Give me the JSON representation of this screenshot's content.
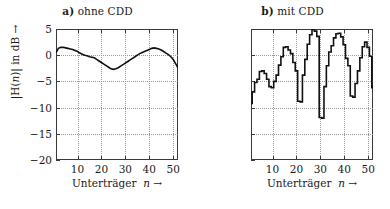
{
  "figure": {
    "background": "#ffffff",
    "ink": "#1a1a1a",
    "grid_color": "#9a9a9a"
  },
  "panels": [
    {
      "id": "panel-a",
      "title_lead": "a)",
      "title_text": "ohne CDD",
      "show_ylabel": true,
      "ylabel_prefix": "|H(",
      "ylabel_var": "n",
      "ylabel_suffix": ")| in dB →",
      "xlabel_text": "Unterträger",
      "xlabel_var": "n",
      "xlabel_arrow": "→"
    },
    {
      "id": "panel-b",
      "title_lead": "b)",
      "title_text": "mit CDD",
      "show_ylabel": false,
      "ylabel_prefix": "|H(",
      "ylabel_var": "n",
      "ylabel_suffix": ")| in dB →",
      "xlabel_text": "Unterträger",
      "xlabel_var": "n",
      "xlabel_arrow": "→"
    }
  ],
  "chart_data": [
    {
      "type": "line",
      "id": "ohne-cdd",
      "title": "a) ohne CDD",
      "xlabel": "Unterträger n →",
      "ylabel": "|H(n)| in dB →",
      "xlim": [
        1,
        52
      ],
      "ylim": [
        -20,
        5
      ],
      "xticks": [
        10,
        20,
        30,
        40,
        50
      ],
      "yticks": [
        5,
        0,
        -5,
        -10,
        -15,
        -20
      ],
      "xtick_labels": [
        "10",
        "20",
        "30",
        "40",
        "50"
      ],
      "ytick_labels": [
        "5",
        "0",
        "−5",
        "−10",
        "−15",
        "−20"
      ],
      "grid": true,
      "line_color": "#111111",
      "line_width": 1.6,
      "step": false,
      "x": [
        1,
        2,
        3,
        4,
        5,
        6,
        7,
        8,
        9,
        10,
        11,
        12,
        13,
        14,
        15,
        16,
        17,
        18,
        19,
        20,
        21,
        22,
        23,
        24,
        25,
        26,
        27,
        28,
        29,
        30,
        31,
        32,
        33,
        34,
        35,
        36,
        37,
        38,
        39,
        40,
        41,
        42,
        43,
        44,
        45,
        46,
        47,
        48,
        49,
        50,
        51,
        52
      ],
      "values": [
        0.5,
        1.3,
        1.5,
        1.5,
        1.4,
        1.3,
        1.2,
        1.1,
        0.9,
        0.7,
        0.4,
        0.2,
        0.0,
        -0.1,
        -0.3,
        -0.4,
        -0.5,
        -0.8,
        -1.1,
        -1.4,
        -1.7,
        -2.0,
        -2.3,
        -2.6,
        -2.7,
        -2.6,
        -2.4,
        -2.1,
        -1.8,
        -1.5,
        -1.2,
        -0.9,
        -0.6,
        -0.3,
        0.0,
        0.3,
        0.5,
        0.7,
        0.9,
        1.1,
        1.3,
        1.4,
        1.3,
        1.2,
        1.0,
        0.7,
        0.4,
        0.1,
        -0.3,
        -0.8,
        -1.6,
        -2.4
      ]
    },
    {
      "type": "line",
      "id": "mit-cdd",
      "title": "b) mit CDD",
      "xlabel": "Unterträger n →",
      "ylabel": "|H(n)| in dB →",
      "xlim": [
        1,
        52
      ],
      "ylim": [
        -20,
        5
      ],
      "xticks": [
        10,
        20,
        30,
        40,
        50
      ],
      "yticks": [
        5,
        0,
        -5,
        -10,
        -15,
        -20
      ],
      "xtick_labels": [
        "10",
        "20",
        "30",
        "40",
        "50"
      ],
      "ytick_labels": [
        "5",
        "0",
        "−5",
        "−10",
        "−15",
        "−20"
      ],
      "grid": true,
      "line_color": "#111111",
      "line_width": 1.6,
      "step": true,
      "x": [
        1,
        2,
        3,
        4,
        5,
        6,
        7,
        8,
        9,
        10,
        11,
        12,
        13,
        14,
        15,
        16,
        17,
        18,
        19,
        20,
        21,
        22,
        23,
        24,
        25,
        26,
        27,
        28,
        29,
        30,
        31,
        32,
        33,
        34,
        35,
        36,
        37,
        38,
        39,
        40,
        41,
        42,
        43,
        44,
        45,
        46,
        47,
        48,
        49,
        50,
        51,
        52
      ],
      "values": [
        -9.2,
        -7.0,
        -5.2,
        -4.6,
        -3.1,
        -3.0,
        -3.5,
        -4.6,
        -6.0,
        -6.2,
        -5.0,
        -3.8,
        -1.9,
        -0.3,
        1.5,
        1.6,
        1.0,
        0.3,
        -1.4,
        -3.0,
        -8.8,
        -8.9,
        -3.8,
        -0.8,
        2.1,
        3.9,
        4.9,
        4.6,
        3.6,
        -11.9,
        -12.0,
        -6.0,
        -2.0,
        0.6,
        1.8,
        3.3,
        4.1,
        4.2,
        3.5,
        2.0,
        -0.6,
        -2.0,
        -7.8,
        -8.0,
        -5.4,
        -3.0,
        -0.5,
        1.6,
        2.5,
        1.5,
        -0.2,
        -6.2,
        -16.5
      ]
    }
  ]
}
